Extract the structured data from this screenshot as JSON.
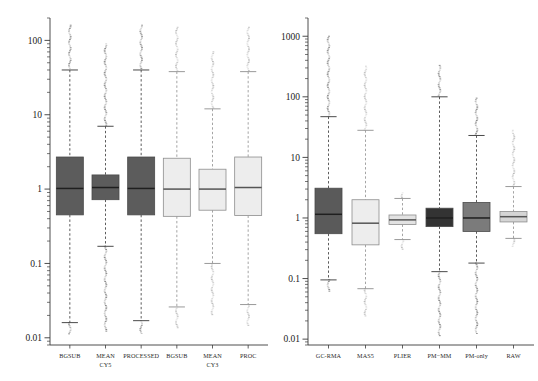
{
  "figure": {
    "background": "#ffffff",
    "width": 538,
    "height": 381
  },
  "chart_data": [
    {
      "type": "box",
      "panel": "left",
      "title": "",
      "xlabel": "",
      "ylabel": "",
      "yscale": "log",
      "ylim": [
        0.008,
        200
      ],
      "ytick_labels": [
        "100",
        "10",
        "1",
        "0.1",
        "0.01"
      ],
      "ytick_values": [
        100,
        10,
        1,
        0.1,
        0.01
      ],
      "grid": false,
      "legend": "none",
      "categories": [
        "BGSUB",
        "MEAN",
        "PROCESSED",
        "BGSUB",
        "MEAN",
        "PROC"
      ],
      "category_sublabels": [
        "",
        "CY5",
        "",
        "",
        "CY3",
        ""
      ],
      "boxes": [
        {
          "label": "BGSUB",
          "sublabel": "",
          "fill": "#5c5c5c",
          "q1": 0.45,
          "median": 1.02,
          "q3": 2.7,
          "whisker_low": 0.016,
          "whisker_high": 40,
          "outlier_high": 160,
          "outlier_low": 0.011
        },
        {
          "label": "MEAN",
          "sublabel": "CY5",
          "fill": "#5c5c5c",
          "q1": 0.72,
          "median": 1.05,
          "q3": 1.55,
          "whisker_low": 0.17,
          "whisker_high": 7.0,
          "outlier_high": 90,
          "outlier_low": 0.012
        },
        {
          "label": "PROCESSED",
          "sublabel": "",
          "fill": "#5c5c5c",
          "q1": 0.45,
          "median": 1.02,
          "q3": 2.7,
          "whisker_low": 0.017,
          "whisker_high": 40,
          "outlier_high": 160,
          "outlier_low": 0.011
        },
        {
          "label": "BGSUB",
          "sublabel": "",
          "fill": "#ededed",
          "q1": 0.43,
          "median": 1.0,
          "q3": 2.6,
          "whisker_low": 0.026,
          "whisker_high": 38,
          "outlier_high": 150,
          "outlier_low": 0.013
        },
        {
          "label": "MEAN",
          "sublabel": "CY3",
          "fill": "#ededed",
          "q1": 0.52,
          "median": 1.0,
          "q3": 1.85,
          "whisker_low": 0.1,
          "whisker_high": 12,
          "outlier_high": 70,
          "outlier_low": 0.02
        },
        {
          "label": "PROC",
          "sublabel": "",
          "fill": "#ededed",
          "q1": 0.44,
          "median": 1.05,
          "q3": 2.7,
          "whisker_low": 0.028,
          "whisker_high": 38,
          "outlier_high": 150,
          "outlier_low": 0.014
        }
      ]
    },
    {
      "type": "box",
      "panel": "right",
      "title": "",
      "xlabel": "",
      "ylabel": "",
      "yscale": "log",
      "ylim": [
        0.008,
        2000
      ],
      "ytick_labels": [
        "1000",
        "100",
        "10",
        "1",
        "0.1",
        "0.01"
      ],
      "ytick_values": [
        1000,
        100,
        10,
        1,
        0.1,
        0.01
      ],
      "grid": false,
      "legend": "none",
      "categories": [
        "GC-RMA",
        "MAS5",
        "PLIER",
        "PM−MM",
        "PM-only",
        "RAW"
      ],
      "boxes": [
        {
          "label": "GC-RMA",
          "fill": "#5a5a5a",
          "q1": 0.55,
          "median": 1.15,
          "q3": 3.1,
          "whisker_low": 0.095,
          "whisker_high": 47,
          "outlier_high": 1000,
          "outlier_low": 0.06
        },
        {
          "label": "MAS5",
          "fill": "#ededed",
          "q1": 0.36,
          "median": 0.82,
          "q3": 2.0,
          "whisker_low": 0.068,
          "whisker_high": 28,
          "outlier_high": 320,
          "outlier_low": 0.024
        },
        {
          "label": "PLIER",
          "fill": "#e2e2e2",
          "q1": 0.78,
          "median": 0.93,
          "q3": 1.12,
          "whisker_low": 0.44,
          "whisker_high": 2.1,
          "outlier_high": 2.6,
          "outlier_low": 0.3
        },
        {
          "label": "PM−MM",
          "fill": "#333333",
          "q1": 0.72,
          "median": 1.0,
          "q3": 1.45,
          "whisker_low": 0.13,
          "whisker_high": 100,
          "outlier_high": 330,
          "outlier_low": 0.011
        },
        {
          "label": "PM-only",
          "fill": "#7b7b7b",
          "q1": 0.6,
          "median": 1.0,
          "q3": 1.8,
          "whisker_low": 0.18,
          "whisker_high": 23,
          "outlier_high": 95,
          "outlier_low": 0.012
        },
        {
          "label": "RAW",
          "fill": "#d5d5d5",
          "q1": 0.86,
          "median": 1.05,
          "q3": 1.28,
          "whisker_low": 0.46,
          "whisker_high": 3.3,
          "outlier_high": 28,
          "outlier_low": 0.33
        }
      ]
    }
  ]
}
